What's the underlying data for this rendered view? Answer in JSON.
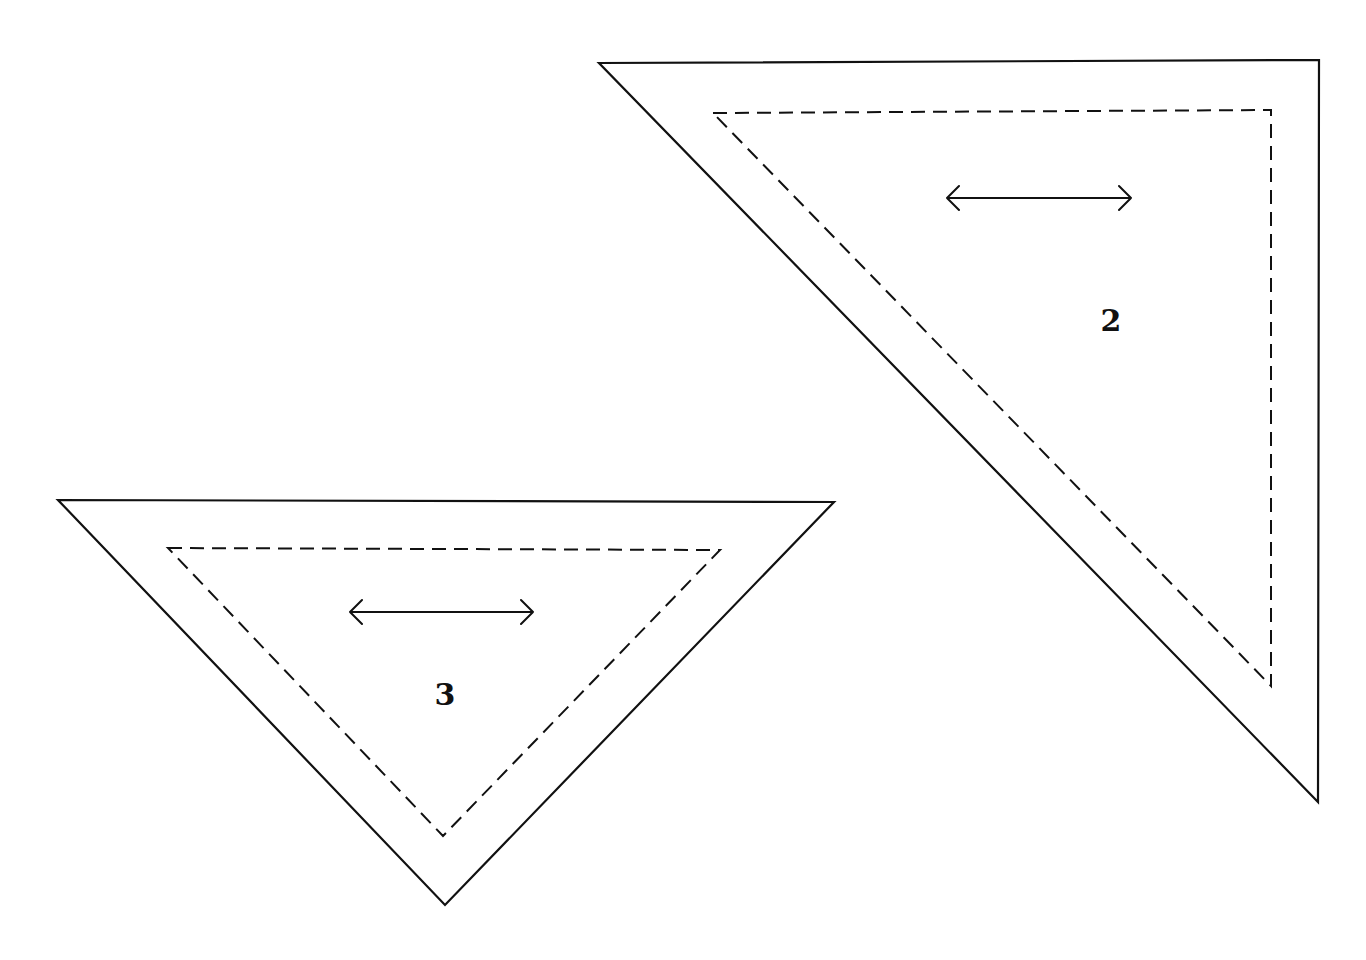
{
  "diagram": {
    "pieces": [
      {
        "label": "2",
        "outer": [
          [
            599,
            63
          ],
          [
            1319,
            60
          ],
          [
            1318,
            802
          ]
        ],
        "inner": [
          [
            713,
            113
          ],
          [
            1271,
            110
          ],
          [
            1271,
            686
          ]
        ],
        "grain_arrow": {
          "x1": 947,
          "x2": 1131,
          "y": 198
        },
        "label_pos": [
          1111,
          331
        ]
      },
      {
        "label": "3",
        "outer": [
          [
            58,
            500
          ],
          [
            834,
            502
          ],
          [
            445,
            905
          ]
        ],
        "inner": [
          [
            168,
            548
          ],
          [
            720,
            550
          ],
          [
            443,
            836
          ]
        ],
        "grain_arrow": {
          "x1": 350,
          "x2": 533,
          "y": 612
        },
        "label_pos": [
          445,
          705
        ]
      }
    ],
    "line_color": "#111111",
    "background": "#ffffff"
  }
}
